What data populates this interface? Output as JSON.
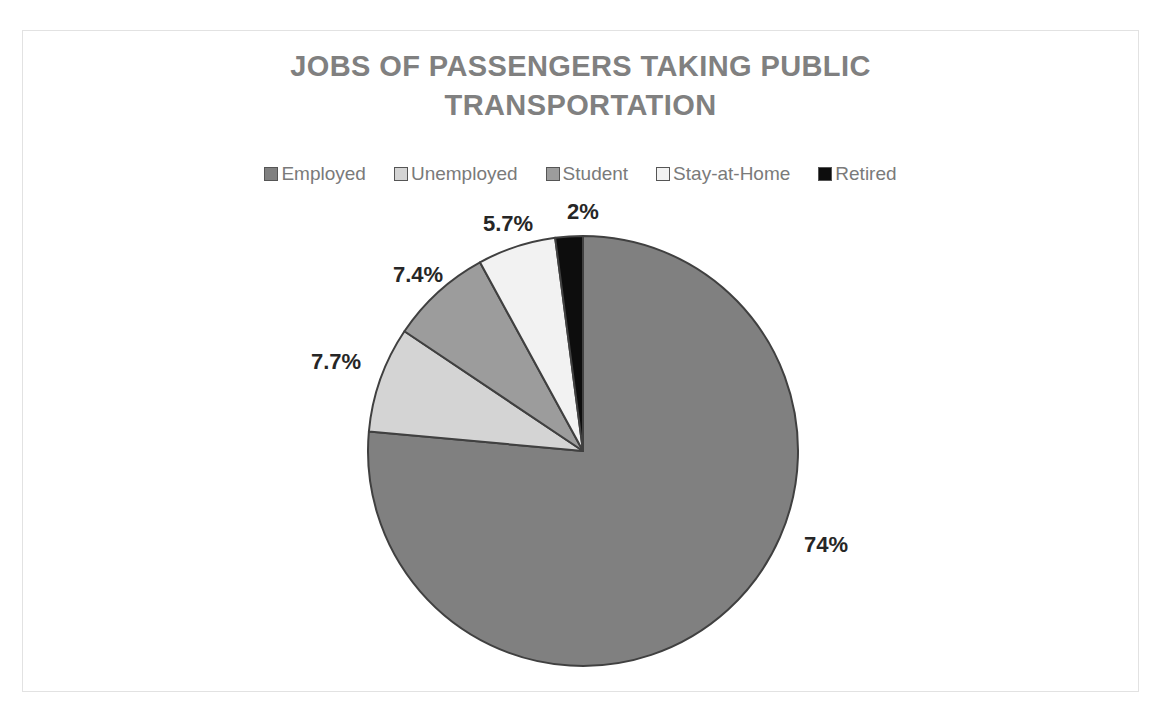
{
  "chart_data": {
    "type": "pie",
    "title": "JOBS OF PASSENGERS TAKING PUBLIC TRANSPORTATION",
    "title_lines": [
      "JOBS OF PASSENGERS TAKING PUBLIC",
      "TRANSPORTATION"
    ],
    "categories": [
      "Employed",
      "Unemployed",
      "Student",
      "Stay-at-Home",
      "Retired"
    ],
    "values": [
      74,
      7.7,
      7.4,
      5.7,
      2
    ],
    "labels": [
      "74%",
      "7.7%",
      "7.4%",
      "5.7%",
      "2%"
    ],
    "colors": [
      "#808080",
      "#d4d4d4",
      "#9c9c9c",
      "#f2f2f2",
      "#0d0d0d"
    ],
    "slice_order_clockwise_from_top": [
      "Employed",
      "Unemployed",
      "Student",
      "Stay-at-Home",
      "Retired"
    ],
    "units": "percent",
    "legend_position": "top",
    "grid": false,
    "xlabel": "",
    "ylabel": "",
    "title_color": "#808080",
    "label_color": "#262626",
    "slice_border_color": "#404040",
    "frame_border_color": "#e2e2e2",
    "background_color": "#ffffff"
  },
  "legend": {
    "items": [
      {
        "label": "Employed",
        "color": "#808080"
      },
      {
        "label": "Unemployed",
        "color": "#d4d4d4"
      },
      {
        "label": "Student",
        "color": "#9c9c9c"
      },
      {
        "label": "Stay-at-Home",
        "color": "#f2f2f2"
      },
      {
        "label": "Retired",
        "color": "#0d0d0d"
      }
    ]
  },
  "data_labels": [
    {
      "name": "employed",
      "text": "74%",
      "left": 803,
      "top": 533
    },
    {
      "name": "unemployed",
      "text": "7.7%",
      "left": 310,
      "top": 350
    },
    {
      "name": "student",
      "text": "7.4%",
      "left": 392,
      "top": 263
    },
    {
      "name": "stay-at-home",
      "text": "5.7%",
      "left": 482,
      "top": 212
    },
    {
      "name": "retired",
      "text": "2%",
      "left": 566,
      "top": 200
    }
  ],
  "geometry": {
    "center_x": 582,
    "center_y": 450,
    "radius": 215
  }
}
